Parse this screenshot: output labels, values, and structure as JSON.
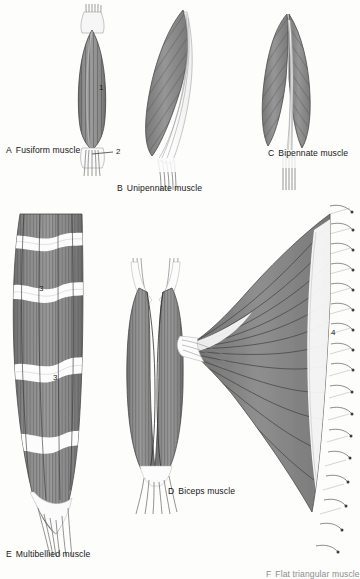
{
  "figure": {
    "background_color": "#fdfdfb",
    "muscle_fill": "#8a8a8a",
    "tendon_fill": "#ffffff",
    "line_color": "#3b3b3b"
  },
  "captions": [
    {
      "id": "A",
      "letter": "A",
      "label": "Fusiform muscle"
    },
    {
      "id": "B",
      "letter": "B",
      "label": "Unipennate muscle"
    },
    {
      "id": "C",
      "letter": "C",
      "label": "Bipennate muscle"
    },
    {
      "id": "D",
      "letter": "D",
      "label": "Biceps muscle"
    },
    {
      "id": "E",
      "letter": "E",
      "label": "Multibellied muscle"
    },
    {
      "id": "F",
      "letter": "F",
      "label": "Flat triangular muscle"
    }
  ],
  "callouts": [
    {
      "id": "n1",
      "number": "1",
      "refers_to": "muscle-belly"
    },
    {
      "id": "n2",
      "number": "2",
      "refers_to": "tendon"
    },
    {
      "id": "n3a",
      "number": "3",
      "refers_to": "tendinous-intersection"
    },
    {
      "id": "n3b",
      "number": "3",
      "refers_to": "tendinous-intersection"
    },
    {
      "id": "n4",
      "number": "4",
      "refers_to": "aponeurosis"
    }
  ]
}
